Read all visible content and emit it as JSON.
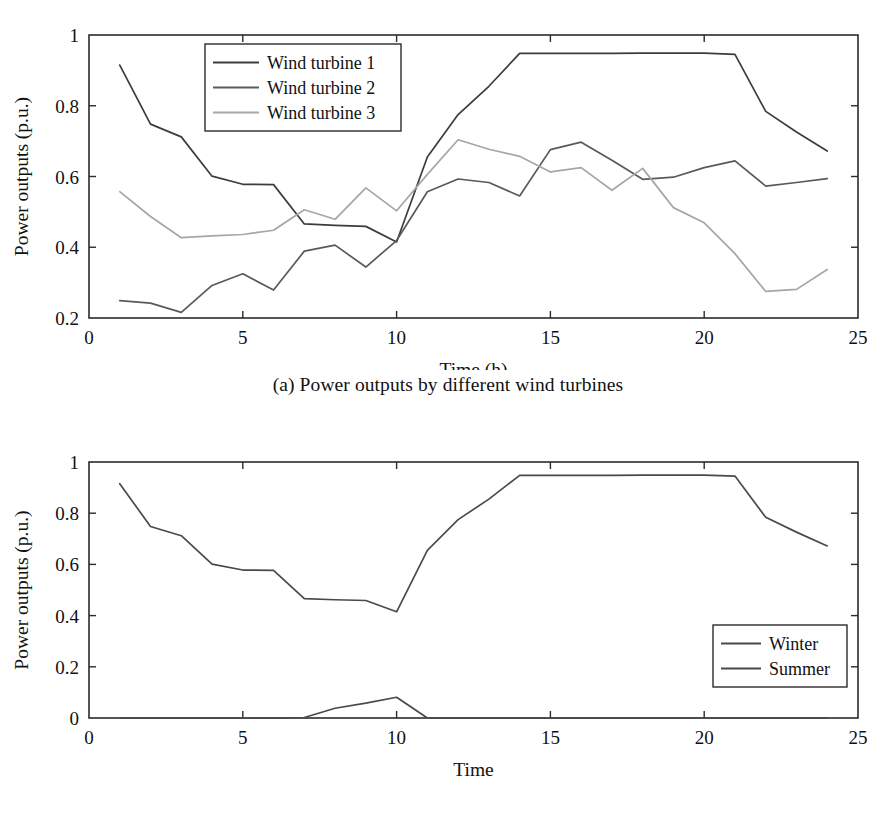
{
  "figure": {
    "background": "#ffffff",
    "panels": [
      {
        "id": "a",
        "caption": "(a) Power outputs by different wind turbines"
      },
      {
        "id": "b",
        "caption": "(b) Power outputs in different seasons"
      }
    ]
  },
  "chart_data": [
    {
      "type": "line",
      "title": "",
      "caption": "(a) Power outputs by different wind turbines",
      "xlabel": "Time (h)",
      "ylabel": "Power outputs (p.u.)",
      "xlim": [
        0,
        25
      ],
      "ylim": [
        0.2,
        1
      ],
      "xticks": [
        0,
        5,
        10,
        15,
        20,
        25
      ],
      "xtick_labels": [
        "0",
        "5",
        "10",
        "15",
        "20",
        "25"
      ],
      "yticks": [
        0.2,
        0.4,
        0.6,
        0.8,
        1
      ],
      "ytick_labels": [
        "0.2",
        "0.4",
        "0.6",
        "0.8",
        "1"
      ],
      "grid": false,
      "legend_position": "upper-left-inside",
      "x": [
        1,
        2,
        3,
        4,
        5,
        6,
        7,
        8,
        9,
        10,
        11,
        12,
        13,
        14,
        15,
        16,
        17,
        18,
        19,
        20,
        21,
        22,
        23,
        24
      ],
      "series": [
        {
          "name": "Wind turbine 1",
          "color": "#3c3c3c",
          "values": [
            0.915,
            0.748,
            0.712,
            0.601,
            0.578,
            0.577,
            0.466,
            0.462,
            0.459,
            0.415,
            0.655,
            0.775,
            0.855,
            0.948,
            0.948,
            0.948,
            0.948,
            0.949,
            0.949,
            0.949,
            0.945,
            0.784,
            0.726,
            0.672
          ]
        },
        {
          "name": "Wind turbine 2",
          "color": "#595959",
          "values": [
            0.249,
            0.242,
            0.216,
            0.292,
            0.325,
            0.279,
            0.389,
            0.406,
            0.344,
            0.419,
            0.557,
            0.593,
            0.583,
            0.545,
            0.676,
            0.697,
            0.646,
            0.592,
            0.598,
            0.625,
            0.644,
            0.573,
            0.583,
            0.594
          ]
        },
        {
          "name": "Wind turbine 3",
          "color": "#a6a6a6",
          "values": [
            0.557,
            0.487,
            0.427,
            0.432,
            0.436,
            0.448,
            0.506,
            0.479,
            0.568,
            0.503,
            0.606,
            0.704,
            0.677,
            0.657,
            0.613,
            0.625,
            0.561,
            0.623,
            0.512,
            0.469,
            0.382,
            0.275,
            0.281,
            0.337
          ]
        }
      ]
    },
    {
      "type": "line",
      "title": "",
      "caption": "(b) Power outputs in different seasons",
      "xlabel": "Time",
      "ylabel": "Power outputs (p.u.)",
      "xlim": [
        0,
        25
      ],
      "ylim": [
        0,
        1
      ],
      "xticks": [
        0,
        5,
        10,
        15,
        20,
        25
      ],
      "xtick_labels": [
        "0",
        "5",
        "10",
        "15",
        "20",
        "25"
      ],
      "yticks": [
        0,
        0.2,
        0.4,
        0.6,
        0.8,
        1
      ],
      "ytick_labels": [
        "0",
        "0.2",
        "0.4",
        "0.6",
        "0.8",
        "1"
      ],
      "grid": false,
      "legend_position": "lower-right-inside",
      "x": [
        1,
        2,
        3,
        4,
        5,
        6,
        7,
        8,
        9,
        10,
        11,
        12,
        13,
        14,
        15,
        16,
        17,
        18,
        19,
        20,
        21,
        22,
        23,
        24
      ],
      "series": [
        {
          "name": "Winter",
          "color": "#4a4a4a",
          "values": [
            0.915,
            0.748,
            0.712,
            0.601,
            0.578,
            0.577,
            0.466,
            0.462,
            0.459,
            0.415,
            0.655,
            0.775,
            0.855,
            0.948,
            0.948,
            0.948,
            0.948,
            0.949,
            0.949,
            0.949,
            0.945,
            0.784,
            0.726,
            0.672
          ]
        },
        {
          "name": "Summer",
          "color": "#4a4a4a",
          "values": [
            0,
            0,
            0,
            0,
            0,
            0,
            0.002,
            0.038,
            0.058,
            0.081,
            0,
            0,
            0,
            0,
            0,
            0,
            0,
            0,
            0,
            0,
            0,
            0,
            0,
            0
          ]
        }
      ]
    }
  ]
}
